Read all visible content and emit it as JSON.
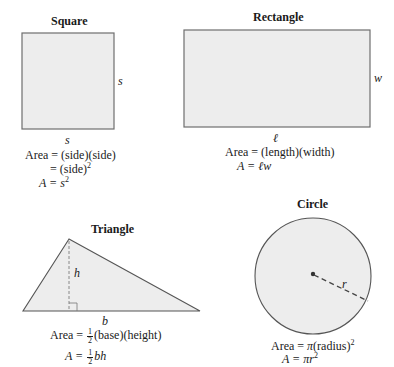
{
  "shapes": {
    "square": {
      "title": "Square",
      "side_label": "s",
      "bottom_label": "s",
      "formula_line1": "Area = (side)(side)",
      "formula_line2_prefix": "= (side)",
      "formula_line2_exp": "2",
      "formula_line3_prefix": "A = ",
      "formula_line3_var": "s",
      "formula_line3_exp": "2"
    },
    "rectangle": {
      "title": "Rectangle",
      "side_label": "w",
      "bottom_label": "ℓ",
      "formula_line1": "Area = (length)(width)",
      "formula_line2_prefix": "A = ",
      "formula_line2_var": "ℓw"
    },
    "triangle": {
      "title": "Triangle",
      "height_label": "h",
      "base_label": "b",
      "formula_line1_prefix": "Area = ",
      "formula_line1_num": "1",
      "formula_line1_den": "2",
      "formula_line1_suffix": "(base)(height)",
      "formula_line2_prefix": "A = ",
      "formula_line2_num": "1",
      "formula_line2_den": "2",
      "formula_line2_var": "bh"
    },
    "circle": {
      "title": "Circle",
      "radius_label": "r",
      "formula_line1_prefix": "Area = ",
      "formula_line1_pi": "π",
      "formula_line1_suffix": "(radius)",
      "formula_line1_exp": "2",
      "formula_line2_prefix": "A = ",
      "formula_line2_var": "πr",
      "formula_line2_exp": "2"
    }
  },
  "colors": {
    "fill": "#ededed",
    "stroke": "#6e6e6e",
    "text": "#1a1a1a"
  }
}
